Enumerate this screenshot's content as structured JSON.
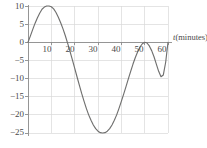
{
  "chart_data": {
    "type": "line",
    "title": "",
    "subtitle": "",
    "xlabel": "t (minutes)",
    "ylabel": "",
    "xlim": [
      0,
      60
    ],
    "ylim": [
      -25,
      10
    ],
    "grid": true,
    "legend": null,
    "legend_position": "none",
    "x_ticks": [
      10,
      20,
      30,
      40,
      50,
      60
    ],
    "x_tick_labels": [
      "10",
      "20",
      "30",
      "40",
      "50",
      "60"
    ],
    "y_ticks": [
      10,
      5,
      0,
      -5,
      -10,
      -15,
      -20,
      -25
    ],
    "y_tick_labels": [
      "10",
      "5",
      "0",
      "−5",
      "−10",
      "−15",
      "−20",
      "−25"
    ],
    "x_gridlines": [
      0,
      10,
      20,
      30,
      40,
      50,
      60
    ],
    "y_gridlines": [
      10,
      5,
      0,
      -5,
      -10,
      -15,
      -20,
      -25
    ],
    "series": [
      {
        "name": "curve",
        "color": "#70706f",
        "x": [
          0,
          1,
          2,
          3,
          4,
          5,
          6,
          7,
          8,
          9,
          10,
          11,
          12,
          13,
          14,
          15,
          16,
          17,
          18,
          19,
          20,
          21,
          22,
          23,
          24,
          25,
          26,
          27,
          28,
          29,
          30,
          31,
          32,
          33,
          34,
          35,
          36,
          37,
          38,
          39,
          40,
          41,
          42,
          43,
          44,
          45,
          46,
          47,
          48,
          49,
          50,
          51,
          52,
          53,
          54,
          55,
          56,
          57,
          58,
          59,
          60
        ],
        "y": [
          0.0,
          1.7,
          3.5,
          5.2,
          6.7,
          8.0,
          9.1,
          9.7,
          10.0,
          10.0,
          9.8,
          9.2,
          8.2,
          6.9,
          5.4,
          3.7,
          1.8,
          -0.3,
          -2.5,
          -4.8,
          -7.1,
          -9.5,
          -11.8,
          -14.1,
          -16.2,
          -18.2,
          -20.0,
          -21.5,
          -22.8,
          -23.8,
          -24.5,
          -24.9,
          -25.0,
          -24.9,
          -24.5,
          -23.8,
          -22.8,
          -21.5,
          -20.0,
          -18.2,
          -16.3,
          -14.3,
          -12.2,
          -10.1,
          -8.0,
          -6.0,
          -4.2,
          -2.6,
          -1.3,
          -0.4,
          0.0,
          -0.2,
          -1.0,
          -2.3,
          -4.0,
          -6.0,
          -8.0,
          -9.5,
          -9.0,
          -5.5,
          0.0
        ]
      }
    ],
    "key_points": {
      "start": {
        "t": 0,
        "value": 0
      },
      "maximum": {
        "t": 8.5,
        "value": 10
      },
      "zero_crossing_down": {
        "t": 17.8,
        "value": 0
      },
      "minimum": {
        "t": 32,
        "value": -25
      },
      "end": {
        "t": 60,
        "value": 0
      }
    },
    "axis_color": "#8c8c8c",
    "grid_color": "#d9d9d9",
    "text_color": "#4a4a4a"
  },
  "axis": {
    "x_title_variable": "t",
    "x_title_unit": "(minutes)"
  }
}
